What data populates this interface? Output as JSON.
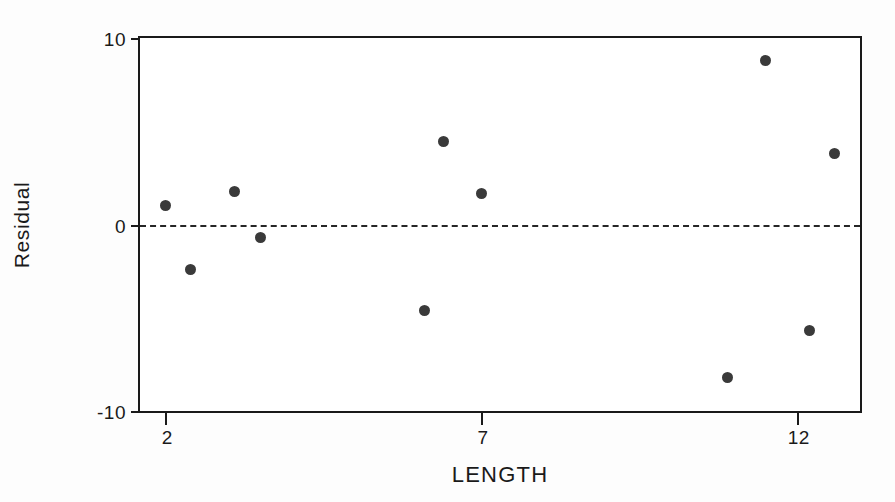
{
  "chart_data": {
    "type": "scatter",
    "title": "",
    "subtitle": "",
    "xlabel": "LENGTH",
    "ylabel": "Residual",
    "xlim": [
      1.6,
      13.0
    ],
    "ylim": [
      -10,
      10
    ],
    "xticks": [
      "2",
      "7",
      "12"
    ],
    "xtick_values": [
      2,
      7,
      12
    ],
    "yticks": [
      "10",
      "0",
      "-10"
    ],
    "ytick_values": [
      10,
      0,
      -10
    ],
    "grid": false,
    "legend": null,
    "reference_line": {
      "name": "zero-residual-line",
      "y": 0,
      "style": "dashed",
      "color": "#262626"
    },
    "series": [
      {
        "name": "residuals",
        "marker": "filled-circle",
        "color": "#3a3a3a",
        "x": [
          2.0,
          2.4,
          3.1,
          3.5,
          6.1,
          6.4,
          7.0,
          10.9,
          11.5,
          12.2,
          12.6
        ],
        "y": [
          1.0,
          -2.4,
          1.75,
          -0.7,
          -4.6,
          4.45,
          1.65,
          -8.2,
          8.8,
          -5.7,
          3.8
        ],
        "points": [
          {
            "x": 2.0,
            "y": 1.0
          },
          {
            "x": 2.4,
            "y": -2.4
          },
          {
            "x": 3.1,
            "y": 1.75
          },
          {
            "x": 3.5,
            "y": -0.7
          },
          {
            "x": 6.1,
            "y": -4.6
          },
          {
            "x": 6.4,
            "y": 4.45
          },
          {
            "x": 7.0,
            "y": 1.65
          },
          {
            "x": 10.9,
            "y": -8.2
          },
          {
            "x": 11.5,
            "y": 8.8
          },
          {
            "x": 12.2,
            "y": -5.7
          },
          {
            "x": 12.6,
            "y": 3.8
          }
        ]
      }
    ]
  },
  "colors": {
    "axis": "#1a1a1a",
    "marker": "#3a3a3a",
    "reference_line": "#262626",
    "background": "#ffffff"
  }
}
